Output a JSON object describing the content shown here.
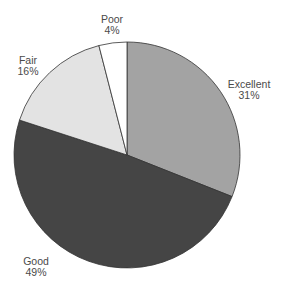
{
  "chart_data": {
    "type": "pie",
    "title": "",
    "categories": [
      "Excellent",
      "Good",
      "Fair",
      "Poor"
    ],
    "values": [
      31,
      49,
      16,
      4
    ],
    "unit": "%",
    "colors": [
      "#a3a3a3",
      "#454545",
      "#e3e3e3",
      "#ffffff"
    ],
    "start_angle_deg": 0,
    "direction": "clockwise",
    "legend": "none",
    "labels": [
      {
        "name": "Excellent",
        "pct": "31%",
        "x": 249,
        "y": 88
      },
      {
        "name": "Good",
        "pct": "49%",
        "x": 36,
        "y": 265
      },
      {
        "name": "Fair",
        "pct": "16%",
        "x": 28,
        "y": 64
      },
      {
        "name": "Poor",
        "pct": "4%",
        "x": 112,
        "y": 23
      }
    ]
  },
  "geometry": {
    "cx": 127,
    "cy": 155,
    "r": 113
  }
}
